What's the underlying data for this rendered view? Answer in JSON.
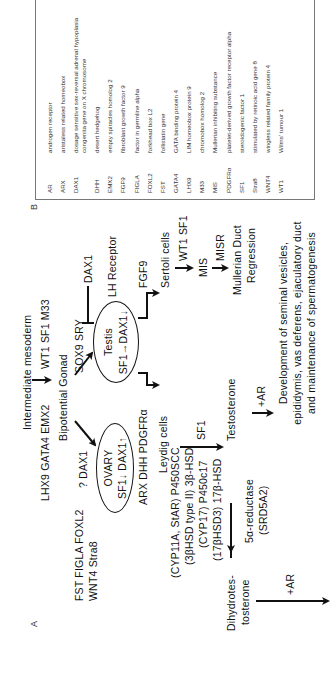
{
  "panel_a": {
    "label": "A",
    "intermediate_mesoderm": "Intermediate mesoderm",
    "upstream_left": "LHX9  GATA4  EMX2",
    "upstream_right": "WT1  SF1  M33",
    "ovary_factors_line1": "FST  FIGLA  FOXL2",
    "ovary_factors_line2": "WNT4  Stra8",
    "bipotential_gonad": "Bipotential Gonad",
    "q_dax1": "? DAX1",
    "ovary": {
      "title": "OVARY",
      "subtitle": "SF1↓ DAX1↑"
    },
    "testis": {
      "title": "Testis",
      "subtitle": "SF1→DAX1↓"
    },
    "sox9_sry": "SOX9  SRY",
    "dax1_inhibitor": "DAX1",
    "lh_receptor": "LH Receptor",
    "fgf9": "FGF9",
    "sertoli_cells": "Sertoli cells",
    "wt1_sf1": "WT1 SF1",
    "mis": "MIS",
    "misr": "MISR",
    "mullerian_line1": "Mullerian Duct",
    "mullerian_line2": "Regression",
    "leydig_factors": "ARX  DHH  PDGFRα",
    "leydig_cells": "Leydig cells",
    "enzymes": [
      "(CYP11A, StAR) P450SCC",
      "(3βHSD type II) 3β-HSD",
      "(CYP17) P450c17",
      "(17βHSD3) 17β-HSD"
    ],
    "sf1": "SF1",
    "testosterone": "Testosterone",
    "ar_testosterone": "+AR",
    "reductase_line1": "5α-reductase",
    "reductase_line2": "(SRD5A2)",
    "dht_line1": "Dihydrotes-",
    "dht_line2": "tosterone",
    "ar_dht": "+AR",
    "development_lines": [
      "Development of seminal vesicles,",
      "epididymis, vas deferens, ejaculatory duct",
      "and maintenance of spermatogenesis"
    ]
  },
  "panel_b": {
    "label": "B",
    "rows": [
      {
        "abbr": "AR",
        "desc": "androgen receptor"
      },
      {
        "abbr": "ARX",
        "desc": "aristaless related homeobox"
      },
      {
        "abbr": "DAX1",
        "desc": "dosage sensitive sex-reversal adrenal hypoplasia congenita gene on X chromosome"
      },
      {
        "abbr": "DHH",
        "desc": "desert hedgehog"
      },
      {
        "abbr": "EMX2",
        "desc": "empty spiracles homolog 2"
      },
      {
        "abbr": "FGF9",
        "desc": "fibroblast growth factor 9"
      },
      {
        "abbr": "FIGLA",
        "desc": "factor in germline alpha"
      },
      {
        "abbr": "FOXL2",
        "desc": "forkhead box L2"
      },
      {
        "abbr": "FST",
        "desc": "follistatin gene"
      },
      {
        "abbr": "GATA4",
        "desc": "GATA binding protein 4"
      },
      {
        "abbr": "LHX9",
        "desc": "LIM homeobox protein 9"
      },
      {
        "abbr": "M33",
        "desc": "chromobox homolog 2"
      },
      {
        "abbr": "MIS",
        "desc": "Mullerian inhibiting substance"
      },
      {
        "abbr": "PDGFRα",
        "desc": "platelet-derived growth factor receptor alpha"
      },
      {
        "abbr": "SF1",
        "desc": "steroidogenic factor 1"
      },
      {
        "abbr": "Stra8",
        "desc": "stimulated by retinoic acid gene 8"
      },
      {
        "abbr": "WNT4",
        "desc": "wingless related family protein 4"
      },
      {
        "abbr": "WT1",
        "desc": "Wilms' tumour 1"
      }
    ]
  },
  "colors": {
    "ink": "#111111",
    "table_border": "#777777",
    "table_text": "#333333"
  }
}
